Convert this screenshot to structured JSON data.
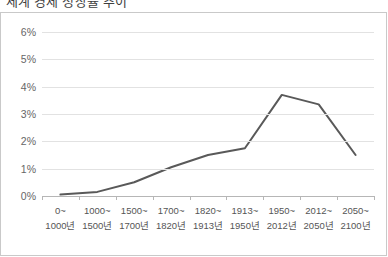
{
  "title": "세계 경제 성장률 추이",
  "frame": {
    "border_color": "#c9c9c9"
  },
  "axes": {
    "y_ticks": [
      "6%",
      "5%",
      "4%",
      "3%",
      "2%",
      "1%",
      "0%"
    ],
    "y_values": [
      6,
      5,
      4,
      3,
      2,
      1,
      0
    ],
    "x_labels": [
      {
        "line1": "0~",
        "line2": "1000년"
      },
      {
        "line1": "1000~",
        "line2": "1500년"
      },
      {
        "line1": "1500~",
        "line2": "1700년"
      },
      {
        "line1": "1700~",
        "line2": "1820년"
      },
      {
        "line1": "1820~",
        "line2": "1913년"
      },
      {
        "line1": "1913~",
        "line2": "1950년"
      },
      {
        "line1": "1950~",
        "line2": "2012년"
      },
      {
        "line1": "2012~",
        "line2": "2050년"
      },
      {
        "line1": "2050~",
        "line2": "2100년"
      }
    ]
  },
  "chart_data": {
    "type": "line",
    "title": "세계 경제 성장률 추이",
    "xlabel": "",
    "ylabel": "",
    "ylim": [
      0,
      6
    ],
    "ytick_format": "percent",
    "grid": true,
    "legend": "none",
    "line_color": "#595959",
    "line_width": 2,
    "categories": [
      "0~1000년",
      "1000~1500년",
      "1500~1700년",
      "1700~1820년",
      "1820~1913년",
      "1913~1950년",
      "1950~2012년",
      "2012~2050년",
      "2050~2100년"
    ],
    "values": [
      0.05,
      0.15,
      0.5,
      1.05,
      1.5,
      1.75,
      3.7,
      3.35,
      1.5
    ],
    "unit": "%"
  }
}
